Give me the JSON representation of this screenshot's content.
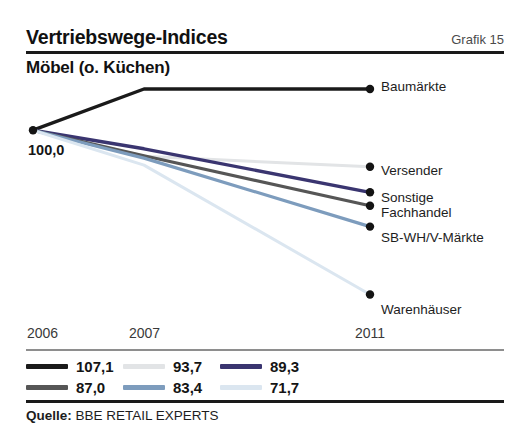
{
  "header": {
    "title": "Vertriebswege-Indices",
    "figure_label": "Grafik 15",
    "subtitle": "Möbel (o. Küchen)"
  },
  "source": {
    "label": "Quelle:",
    "text": "BBE RETAIL EXPERTS"
  },
  "legend": {
    "rows": [
      [
        {
          "value": "107,1",
          "color": "#1a1a1a"
        },
        {
          "value": "93,7",
          "color": "#e2e4e6"
        },
        {
          "value": "89,3",
          "color": "#3a3570"
        }
      ],
      [
        {
          "value": "87,0",
          "color": "#565656"
        },
        {
          "value": "83,4",
          "color": "#7d9cbd"
        },
        {
          "value": "71,7",
          "color": "#dbe6f0"
        }
      ]
    ]
  },
  "chart_data": {
    "type": "line",
    "title": "Möbel (o. Küchen)",
    "subtitle": "Vertriebswege-Indices",
    "xlabel": "",
    "ylabel": "",
    "grid": false,
    "legend_position": "right-inline",
    "base_value_label": "100,0",
    "base_value": 100.0,
    "x": [
      2006,
      2007,
      2011
    ],
    "tick_labels": [
      "2006",
      "2007",
      "2011"
    ],
    "ylim": [
      65,
      112
    ],
    "series": [
      {
        "name": "Baumärkte",
        "color": "#1a1a1a",
        "values": [
          100.0,
          107.1,
          107.1
        ],
        "final_value": "107,1"
      },
      {
        "name": "Versender",
        "color": "#e2e4e6",
        "values": [
          100.0,
          95.5,
          93.7
        ],
        "final_value": "93,7"
      },
      {
        "name": "Sonstige",
        "color": "#3a3570",
        "values": [
          100.0,
          96.8,
          89.3
        ],
        "final_value": "89,3"
      },
      {
        "name": "Fachhandel",
        "color": "#565656",
        "values": [
          100.0,
          95.6,
          87.0
        ],
        "final_value": "87,0"
      },
      {
        "name": "SB-WH/V-Märkte",
        "color": "#7d9cbd",
        "values": [
          100.0,
          95.2,
          83.4
        ],
        "final_value": "83,4"
      },
      {
        "name": "Warenhäuser",
        "color": "#dbe6f0",
        "values": [
          100.0,
          94.0,
          71.7
        ],
        "final_value": "71,7"
      }
    ]
  }
}
